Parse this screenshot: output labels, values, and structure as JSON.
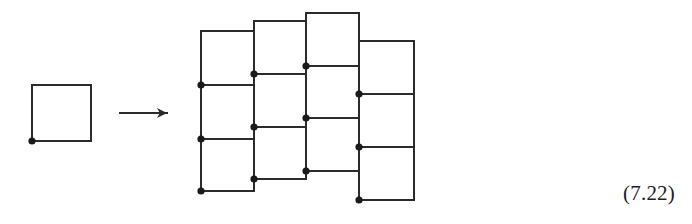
{
  "figure": {
    "kind": "math-diagram",
    "stroke_color": "#2b2b2b",
    "dot_color": "#1a1a1a",
    "background_color": "#ffffff",
    "line_width": 2,
    "dot_radius": 3.6
  },
  "equation_label": {
    "text": "(7.22)",
    "color": "#1d1d1d"
  },
  "arrow": {
    "name": "maps-to-arrow",
    "glyph": "→",
    "x1": 120,
    "y1": 113,
    "x2": 167,
    "y2": 113,
    "head_length": 10,
    "head_half_width": 5
  },
  "source_shape": {
    "label": "single square",
    "squares": [
      {
        "x": 32,
        "y": 85,
        "w": 59,
        "h": 56
      }
    ],
    "dots": [
      {
        "x": 32,
        "y": 141
      }
    ]
  },
  "target_shape": {
    "label": "twelve squares in four offset columns",
    "columns": [
      {
        "index": 1,
        "x_left": 201,
        "x_right": 254,
        "y_lines": [
          31,
          85,
          139,
          191
        ],
        "dot_y": [
          85,
          139,
          191
        ]
      },
      {
        "index": 2,
        "x_left": 254,
        "x_right": 306,
        "y_lines": [
          21,
          74,
          127,
          179
        ],
        "dot_y": [
          74,
          127,
          179
        ]
      },
      {
        "index": 3,
        "x_left": 306,
        "x_right": 359,
        "y_lines": [
          13,
          66,
          118,
          171
        ],
        "dot_y": [
          66,
          118,
          171
        ]
      },
      {
        "index": 4,
        "x_left": 359,
        "x_right": 414,
        "y_lines": [
          41,
          94,
          147,
          200
        ],
        "dot_y": [
          94,
          147,
          200
        ]
      }
    ]
  }
}
